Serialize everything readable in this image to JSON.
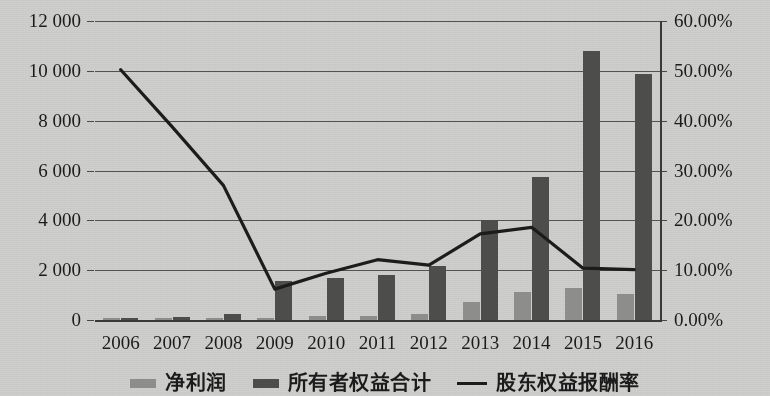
{
  "chart_data": {
    "type": "bar",
    "title": "",
    "xlabel": "",
    "ylabel": "",
    "categories": [
      "2006",
      "2007",
      "2008",
      "2009",
      "2010",
      "2011",
      "2012",
      "2013",
      "2014",
      "2015",
      "2016"
    ],
    "ylim": [
      0,
      12000
    ],
    "y_ticks": [
      "0",
      "2 000",
      "4 000",
      "6 000",
      "8 000",
      "10 000",
      "12 000"
    ],
    "y_tick_values": [
      0,
      2000,
      4000,
      6000,
      8000,
      10000,
      12000
    ],
    "y2lim": [
      0,
      0.6
    ],
    "y2_ticks": [
      "0.00%",
      "10.00%",
      "20.00%",
      "30.00%",
      "40.00%",
      "50.00%",
      "60.00%"
    ],
    "y2_tick_values": [
      0,
      0.1,
      0.2,
      0.3,
      0.4,
      0.5,
      0.6
    ],
    "grid": true,
    "legend_position": "bottom",
    "series": [
      {
        "name": "净利润",
        "type": "bar",
        "axis": "left",
        "color": "#8f8f8d",
        "values": [
          60,
          90,
          85,
          70,
          150,
          160,
          250,
          720,
          1120,
          1270,
          1030
        ]
      },
      {
        "name": "所有者权益合计",
        "type": "bar",
        "axis": "left",
        "color": "#4e4e4c",
        "values": [
          80,
          140,
          250,
          1580,
          1670,
          1800,
          2180,
          4020,
          5720,
          10800,
          9880
        ]
      },
      {
        "name": "股东权益报酬率",
        "type": "line",
        "axis": "right",
        "color": "#1c1c1a",
        "values": [
          0.502,
          0.388,
          0.27,
          0.062,
          0.094,
          0.121,
          0.11,
          0.173,
          0.186,
          0.104,
          0.101
        ]
      }
    ]
  },
  "legend": {
    "items": [
      {
        "label": "净利润",
        "marker": "bar-swatch"
      },
      {
        "label": "所有者权益合计",
        "marker": "bar-swatch"
      },
      {
        "label": "股东权益报酬率",
        "marker": "line-swatch"
      }
    ]
  }
}
